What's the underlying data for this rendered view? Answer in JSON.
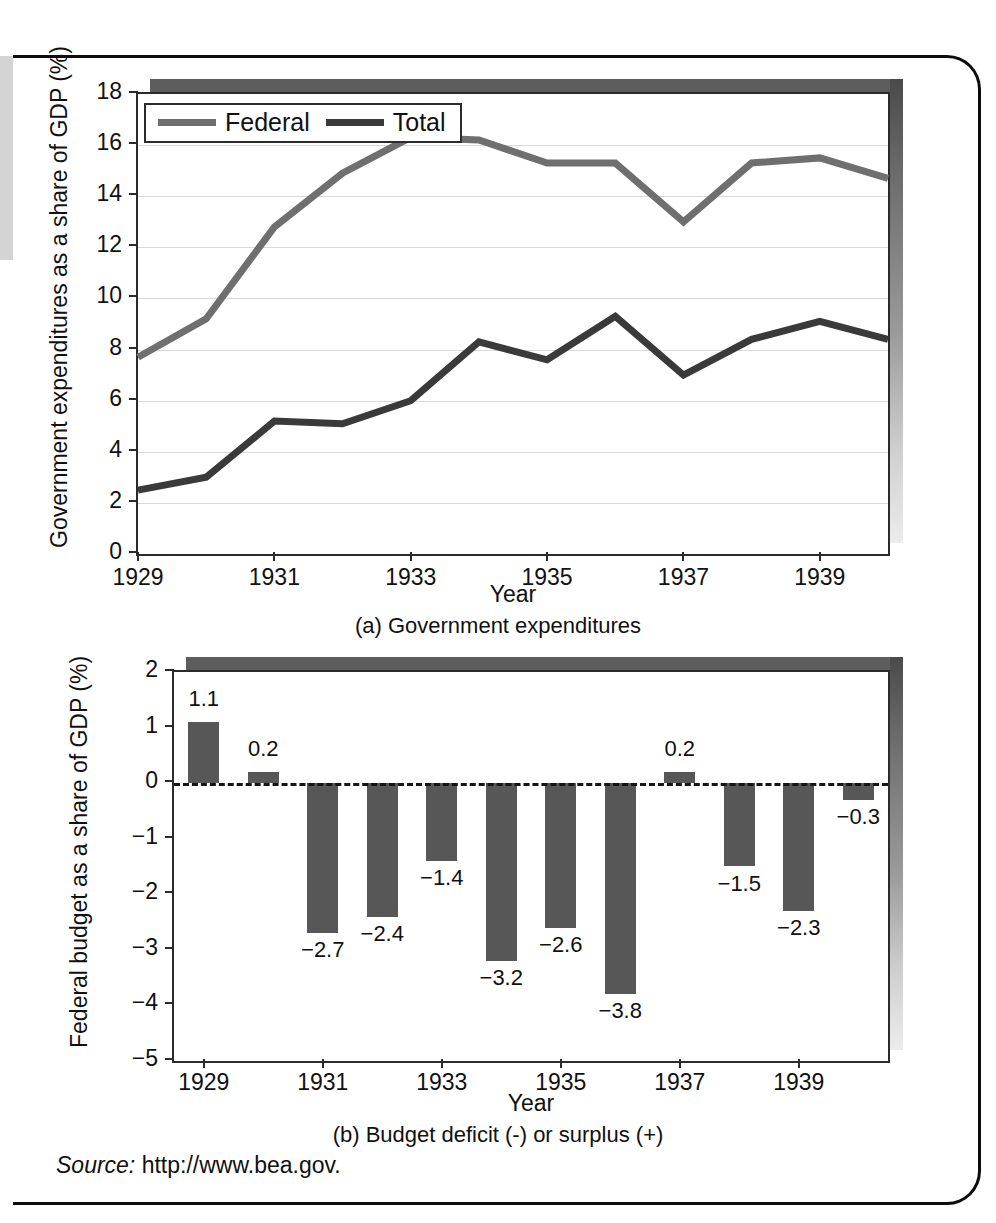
{
  "source": {
    "label": "Source:",
    "url": "http://www.bea.gov."
  },
  "panel_a": {
    "caption": "(a) Government expenditures",
    "xlabel": "Year",
    "ylabel": "Government expenditures as a share of GDP (%)",
    "legend": [
      {
        "name": "Federal",
        "color": "#6f6f6f"
      },
      {
        "name": "Total",
        "color": "#3a3a3a"
      }
    ]
  },
  "panel_b": {
    "caption": "(b) Budget deficit (-) or surplus (+)",
    "xlabel": "Year",
    "ylabel": "Federal budget as a share of GDP (%)"
  },
  "chart_data": [
    {
      "type": "line",
      "id": "panel-a",
      "title": "(a) Government expenditures",
      "xlabel": "Year",
      "ylabel": "Government expenditures as a share of GDP (%)",
      "x": [
        1929,
        1930,
        1931,
        1932,
        1933,
        1934,
        1935,
        1936,
        1937,
        1938,
        1939,
        1940
      ],
      "xlim": [
        1929,
        1940
      ],
      "ylim": [
        0,
        18
      ],
      "yticks": [
        0,
        2,
        4,
        6,
        8,
        10,
        12,
        14,
        16,
        18
      ],
      "xticks": [
        1929,
        1931,
        1933,
        1935,
        1937,
        1939
      ],
      "xticklabels": [
        "1929",
        "1931",
        "1933",
        "1935",
        "1937",
        "1939"
      ],
      "yticklabels": [
        "0",
        "2",
        "4",
        "6",
        "8",
        "10",
        "12",
        "14",
        "16",
        "18"
      ],
      "grid": true,
      "legend_position": "upper left",
      "series": [
        {
          "name": "Federal",
          "color": "#6f6f6f",
          "values": [
            7.7,
            9.2,
            12.8,
            14.9,
            16.3,
            16.2,
            15.3,
            15.3,
            13.0,
            15.3,
            15.5,
            14.7
          ]
        },
        {
          "name": "Total",
          "color": "#3a3a3a",
          "values": [
            2.5,
            3.0,
            5.2,
            5.1,
            6.0,
            8.3,
            7.6,
            9.3,
            7.0,
            8.4,
            9.1,
            8.4
          ]
        }
      ]
    },
    {
      "type": "bar",
      "id": "panel-b",
      "title": "(b) Budget deficit (-) or surplus (+)",
      "xlabel": "Year",
      "ylabel": "Federal budget as a share of GDP (%)",
      "categories": [
        "1929",
        "1930",
        "1931",
        "1932",
        "1933",
        "1934",
        "1935",
        "1936",
        "1937",
        "1938",
        "1939",
        "1940"
      ],
      "values": [
        1.1,
        0.2,
        -2.7,
        -2.4,
        -1.4,
        -3.2,
        -2.6,
        -3.8,
        0.2,
        -1.5,
        -2.3,
        -0.3
      ],
      "data_labels": [
        "1.1",
        "0.2",
        "−2.7",
        "−2.4",
        "−1.4",
        "−3.2",
        "−2.6",
        "−3.8",
        "0.2",
        "−1.5",
        "−2.3",
        "−0.3"
      ],
      "ylim": [
        -5,
        2
      ],
      "yticks": [
        -5,
        -4,
        -3,
        -2,
        -1,
        0,
        1,
        2
      ],
      "yticklabels": [
        "−5",
        "−4",
        "−3",
        "−2",
        "−1",
        "0",
        "1",
        "2"
      ],
      "xticks": [
        1929,
        1931,
        1933,
        1935,
        1937,
        1939
      ],
      "xticklabels": [
        "1929",
        "1931",
        "1933",
        "1935",
        "1937",
        "1939"
      ],
      "bar_color": "#575757",
      "grid": false,
      "zero_line": true
    }
  ]
}
